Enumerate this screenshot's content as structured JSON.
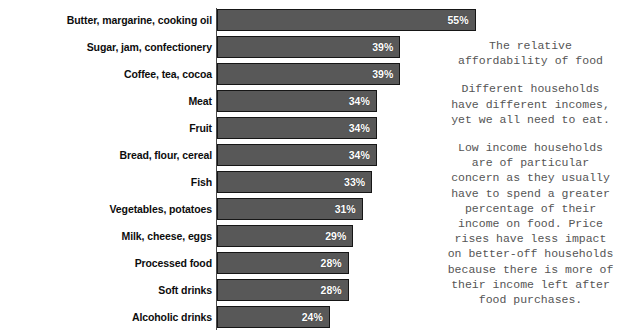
{
  "title_clipped": "(percentage of households)",
  "chart_data": {
    "type": "bar",
    "orientation": "horizontal",
    "title": "",
    "xlabel": "",
    "ylabel": "",
    "xlim": [
      0,
      60
    ],
    "grid": false,
    "legend": "none",
    "value_suffix": "%",
    "bar_color": "#585858",
    "bar_border_color": "#161616",
    "value_label_color": "#ffffff",
    "categories": [
      "Butter, margarine, cooking oil",
      "Sugar, jam, confectionery",
      "Coffee, tea, cocoa",
      "Meat",
      "Fruit",
      "Bread, flour, cereal",
      "Fish",
      "Vegetables, potatoes",
      "Milk, cheese, eggs",
      "Processed food",
      "Soft drinks",
      "Alcoholic drinks"
    ],
    "values": [
      55,
      39,
      39,
      34,
      34,
      34,
      33,
      31,
      29,
      28,
      28,
      24
    ],
    "value_labels": [
      "55%",
      "39%",
      "39%",
      "34%",
      "34%",
      "34%",
      "33%",
      "31%",
      "29%",
      "28%",
      "28%",
      "24%"
    ]
  },
  "side_panel": {
    "heading_lines": [
      "The relative",
      "affordability of food"
    ],
    "paragraph1_lines": [
      "Different households",
      "have different incomes,",
      "yet we all need to eat."
    ],
    "paragraph2_lines": [
      "Low income households",
      "are of particular",
      "concern as they usually",
      "have to spend a greater",
      "percentage of their",
      "income on food. Price",
      "rises have less impact",
      "on better-off households",
      "because there is more of",
      "their income left after",
      "food purchases."
    ]
  }
}
